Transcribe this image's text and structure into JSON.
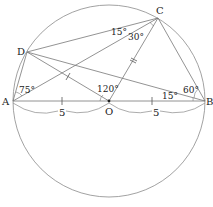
{
  "colors": {
    "stroke": "#777777",
    "text": "#222222",
    "background": "#ffffff"
  },
  "circle": {
    "cx": 109,
    "cy": 101,
    "r": 96
  },
  "points": {
    "A": {
      "label": "A",
      "x": 13,
      "y": 101
    },
    "B": {
      "label": "B",
      "x": 205,
      "y": 101
    },
    "C": {
      "label": "C",
      "x": 158,
      "y": 18
    },
    "D": {
      "label": "D",
      "x": 27,
      "y": 52
    },
    "O": {
      "label": "O",
      "x": 109,
      "y": 101
    }
  },
  "angles": {
    "DAB": "75°",
    "DOA_or_AOC": "120°",
    "DCA": "15°",
    "ACO": "30°",
    "CBD": "60°",
    "DBA": "15°"
  },
  "lengths": {
    "AO": "5",
    "OB": "5"
  },
  "segments": [
    "AB",
    "AC",
    "AD",
    "DC",
    "DB",
    "DO",
    "OC",
    "CB"
  ]
}
